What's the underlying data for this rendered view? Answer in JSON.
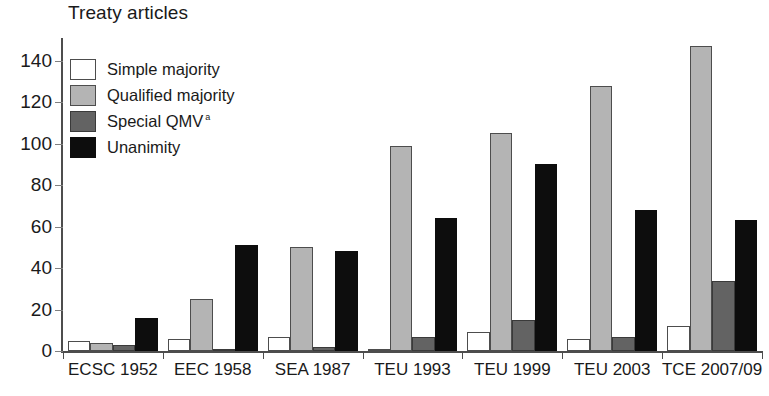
{
  "chart_data": {
    "type": "bar",
    "title": "Treaty articles",
    "xlabel": "",
    "ylabel": "",
    "ylim": [
      0,
      150
    ],
    "yticks": [
      0,
      20,
      40,
      60,
      80,
      100,
      120,
      140
    ],
    "ytick_labels": [
      "0",
      "20",
      "40",
      "60",
      "80",
      "100",
      "120",
      "140"
    ],
    "grid": false,
    "legend_position": "upper left",
    "categories": [
      "ECSC 1952",
      "EEC 1958",
      "SEA 1987",
      "TEU 1993",
      "TEU 1999",
      "TEU 2003",
      "TCE 2007/09"
    ],
    "series": [
      {
        "name": "Simple majority",
        "color": "#ffffff",
        "values": [
          5,
          6,
          7,
          1,
          9,
          6,
          12
        ]
      },
      {
        "name": "Qualified majority",
        "color": "#b4b4b4",
        "values": [
          4,
          25,
          50,
          99,
          105,
          128,
          147
        ]
      },
      {
        "name": "Special QMV",
        "color": "#636363",
        "note_marker": "a",
        "values": [
          3,
          1,
          2,
          7,
          15,
          7,
          34
        ]
      },
      {
        "name": "Unanimity",
        "color": "#0d0d0d",
        "values": [
          16,
          51,
          48,
          64,
          90,
          68,
          63
        ]
      }
    ]
  },
  "legend": {
    "items": [
      {
        "label": "Simple majority",
        "marker": ""
      },
      {
        "label": "Qualified majority",
        "marker": ""
      },
      {
        "label": "Special QMV",
        "marker": "a"
      },
      {
        "label": "Unanimity",
        "marker": ""
      }
    ]
  }
}
